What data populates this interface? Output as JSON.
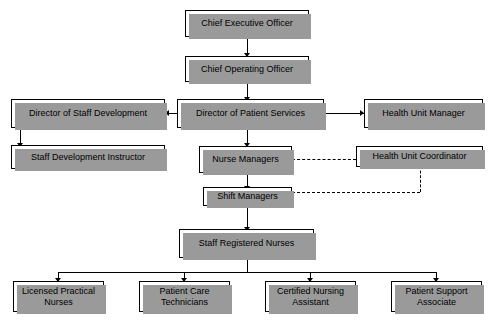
{
  "chart_title": "",
  "nodes": {
    "ceo": {
      "label": "Chief Executive Officer"
    },
    "coo": {
      "label": "Chief Operating Officer"
    },
    "dir_staff_dev": {
      "label": "Director of Staff Development"
    },
    "dir_patient_services": {
      "label": "Director of Patient Services"
    },
    "health_unit_manager": {
      "label": "Health Unit Manager"
    },
    "staff_dev_instructor": {
      "label": "Staff  Development Instructor"
    },
    "nurse_managers": {
      "label": "Nurse Managers"
    },
    "health_unit_coordinator": {
      "label": "Health Unit Coordinator"
    },
    "shift_managers": {
      "label": "Shift Managers"
    },
    "staff_registered_nurses": {
      "label": "Staff Registered Nurses"
    },
    "licensed_practical_nurses": {
      "label": "Licensed Practical\nNurses"
    },
    "patient_care_technicians": {
      "label": "Patient Care\nTechnicians"
    },
    "certified_nursing_assistant": {
      "label": "Certified Nursing\nAssistant"
    },
    "patient_support_associate": {
      "label": "Patient Support\nAssociate"
    }
  },
  "edges": [
    {
      "from": "ceo",
      "to": "coo",
      "style": "solid"
    },
    {
      "from": "coo",
      "to": "dir_patient_services",
      "style": "solid"
    },
    {
      "from": "dir_patient_services",
      "to": "dir_staff_dev",
      "style": "solid"
    },
    {
      "from": "dir_patient_services",
      "to": "health_unit_manager",
      "style": "solid"
    },
    {
      "from": "dir_staff_dev",
      "to": "staff_dev_instructor",
      "style": "solid"
    },
    {
      "from": "dir_patient_services",
      "to": "nurse_managers",
      "style": "solid"
    },
    {
      "from": "nurse_managers",
      "to": "health_unit_coordinator",
      "style": "dashed"
    },
    {
      "from": "nurse_managers",
      "to": "shift_managers",
      "style": "solid"
    },
    {
      "from": "shift_managers",
      "to": "health_unit_coordinator",
      "style": "dashed"
    },
    {
      "from": "shift_managers",
      "to": "staff_registered_nurses",
      "style": "solid"
    },
    {
      "from": "staff_registered_nurses",
      "to": "licensed_practical_nurses",
      "style": "solid"
    },
    {
      "from": "staff_registered_nurses",
      "to": "patient_care_technicians",
      "style": "solid"
    },
    {
      "from": "staff_registered_nurses",
      "to": "certified_nursing_assistant",
      "style": "solid"
    },
    {
      "from": "staff_registered_nurses",
      "to": "patient_support_associate",
      "style": "solid"
    }
  ],
  "colors": {
    "box_fill": "#ffffff",
    "box_border": "#000000",
    "shadow": "#9a9a9a",
    "line": "#000000",
    "background": "#ffffff"
  }
}
